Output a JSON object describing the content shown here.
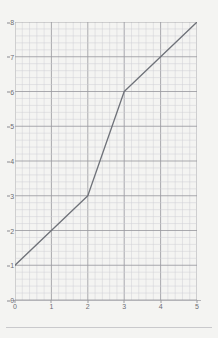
{
  "page": {
    "background_color": "#f4f4f2",
    "rule_color": "#c9c9cc"
  },
  "chart_data": {
    "type": "line",
    "title": "",
    "subtitle": "",
    "xlabel": "",
    "ylabel": "",
    "xlim": [
      0,
      5
    ],
    "ylim": [
      0,
      8
    ],
    "xticks": [
      "0",
      "1",
      "2",
      "3",
      "4",
      "5"
    ],
    "yticks": [
      "0",
      "1",
      "2",
      "3",
      "4",
      "5",
      "6",
      "7",
      "8"
    ],
    "x_minor_per_major": 5,
    "y_minor_per_major": 5,
    "grid": true,
    "grid_major_color": "#9b9ba0",
    "grid_minor_color": "#cfcfd4",
    "legend": null,
    "legend_position": "none",
    "annotations": [],
    "series": [
      {
        "name": "line",
        "color": "#6f7279",
        "x": [
          0,
          2,
          3,
          5
        ],
        "y": [
          1,
          3,
          6,
          8
        ],
        "points": [
          {
            "x": 0,
            "y": 1
          },
          {
            "x": 2,
            "y": 3
          },
          {
            "x": 3,
            "y": 6
          },
          {
            "x": 5,
            "y": 8
          }
        ],
        "segments": [
          {
            "from": [
              0,
              1
            ],
            "to": [
              2,
              3
            ],
            "slope": 1
          },
          {
            "from": [
              2,
              3
            ],
            "to": [
              3,
              6
            ],
            "slope": 3
          },
          {
            "from": [
              3,
              6
            ],
            "to": [
              5,
              8
            ],
            "slope": 1
          }
        ]
      }
    ]
  }
}
